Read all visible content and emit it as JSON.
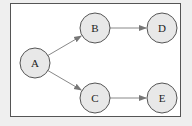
{
  "diagram": {
    "type": "directed-graph",
    "nodes": [
      {
        "id": "A",
        "label": "A",
        "cx": 35,
        "cy": 63
      },
      {
        "id": "B",
        "label": "B",
        "cx": 95,
        "cy": 28
      },
      {
        "id": "C",
        "label": "C",
        "cx": 95,
        "cy": 98
      },
      {
        "id": "D",
        "label": "D",
        "cx": 162,
        "cy": 28
      },
      {
        "id": "E",
        "label": "E",
        "cx": 162,
        "cy": 98
      }
    ],
    "edges": [
      {
        "from": "A",
        "to": "B"
      },
      {
        "from": "A",
        "to": "C"
      },
      {
        "from": "B",
        "to": "D"
      },
      {
        "from": "C",
        "to": "E"
      }
    ],
    "colors": {
      "background": "#efefef",
      "canvas": "#ffffff",
      "node_fill": "#e8e8e8",
      "node_stroke": "#555555",
      "edge": "#888888",
      "frame": "#555555"
    }
  }
}
